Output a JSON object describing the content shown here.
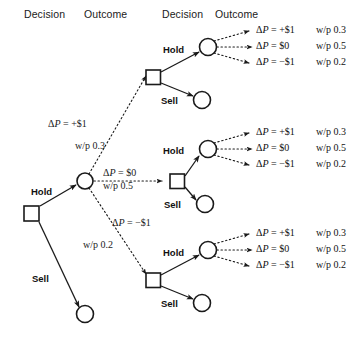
{
  "diagram": {
    "headers": [
      {
        "label": "Decision",
        "x": 24,
        "y": 8
      },
      {
        "label": "Outcome",
        "x": 84,
        "y": 8
      },
      {
        "label": "Decision",
        "x": 162,
        "y": 8
      },
      {
        "label": "Outcome",
        "x": 215,
        "y": 8
      }
    ],
    "colors": {
      "stroke": "#1a1a1a",
      "text": "#111111",
      "background": "#ffffff"
    },
    "root": {
      "decision_label_hold": "Hold",
      "decision_label_sell": "Sell"
    },
    "stage1_branches": [
      {
        "delta_p": "ΔP = +$1",
        "prob": "w/p 0.3"
      },
      {
        "delta_p": "ΔP = $0",
        "prob": "w/p 0.5"
      },
      {
        "delta_p": "ΔP = −$1",
        "prob": "w/p 0.2"
      }
    ],
    "stage2_decisions": [
      {
        "hold": "Hold",
        "sell": "Sell"
      },
      {
        "hold": "Hold",
        "sell": "Sell"
      },
      {
        "hold": "Hold",
        "sell": "Sell"
      }
    ],
    "outcome_groups": [
      {
        "rows": [
          {
            "delta_p": "ΔP = +$1",
            "prob": "w/p 0.3"
          },
          {
            "delta_p": "ΔP = $0",
            "prob": "w/p 0.5"
          },
          {
            "delta_p": "ΔP = −$1",
            "prob": "w/p 0.2"
          }
        ]
      },
      {
        "rows": [
          {
            "delta_p": "ΔP = +$1",
            "prob": "w/p 0.3"
          },
          {
            "delta_p": "ΔP = $0",
            "prob": "w/p 0.5"
          },
          {
            "delta_p": "ΔP = −$1",
            "prob": "w/p 0.2"
          }
        ]
      },
      {
        "rows": [
          {
            "delta_p": "ΔP = +$1",
            "prob": "w/p 0.3"
          },
          {
            "delta_p": "ΔP = $0",
            "prob": "w/p 0.5"
          },
          {
            "delta_p": "ΔP = −$1",
            "prob": "w/p 0.2"
          }
        ]
      }
    ]
  }
}
